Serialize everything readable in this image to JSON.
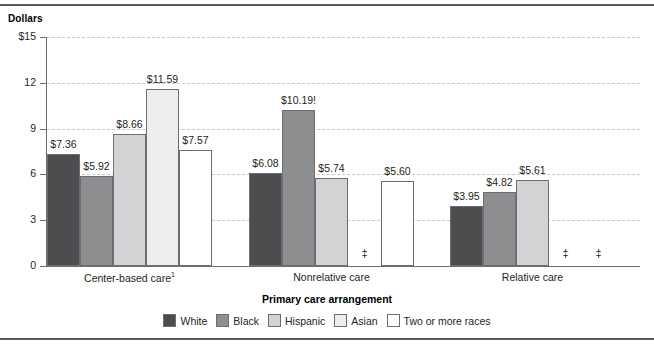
{
  "axis_title_label": "Primary care arrangement",
  "y_axis_caption": "Dollars",
  "legend": {
    "items": [
      {
        "label": "White",
        "color": "#4d4d4f"
      },
      {
        "label": "Black",
        "color": "#8d8e90"
      },
      {
        "label": "Hispanic",
        "color": "#d2d3d4"
      },
      {
        "label": "Asian",
        "color": "#eceded"
      },
      {
        "label": "Two or more races",
        "color": "#ffffff"
      }
    ]
  },
  "suppressed_marker": "‡",
  "chart_data": {
    "type": "bar",
    "title": "",
    "subtitle": "",
    "xlabel": "Primary care arrangement",
    "ylabel": "Dollars",
    "ylim": [
      0,
      15
    ],
    "yticks": [
      0,
      3,
      6,
      9,
      12,
      15
    ],
    "ytick_labels": [
      "0",
      "3",
      "6",
      "9",
      "12",
      "$15"
    ],
    "grid": true,
    "legend_position": "bottom",
    "categories": [
      "Center-based care¹",
      "Nonrelative care",
      "Relative care"
    ],
    "category_labels": [
      {
        "text": "Center-based care",
        "footnote": "1"
      },
      {
        "text": "Nonrelative care",
        "footnote": ""
      },
      {
        "text": "Relative care",
        "footnote": ""
      }
    ],
    "series": [
      {
        "name": "White",
        "color": "#4d4d4f",
        "values": [
          7.36,
          6.08,
          3.95
        ],
        "labels": [
          "$7.36",
          "$6.08",
          "$3.95"
        ]
      },
      {
        "name": "Black",
        "color": "#8d8e90",
        "values": [
          5.92,
          10.19,
          4.82
        ],
        "labels": [
          "$5.92",
          "$10.19!",
          "$4.82"
        ]
      },
      {
        "name": "Hispanic",
        "color": "#d2d3d4",
        "values": [
          8.66,
          5.74,
          5.61
        ],
        "labels": [
          "$8.66",
          "$5.74",
          "$5.61"
        ]
      },
      {
        "name": "Asian",
        "color": "#eceded",
        "values": [
          11.59,
          null,
          null
        ],
        "labels": [
          "$11.59",
          "‡",
          "‡"
        ]
      },
      {
        "name": "Two or more races",
        "color": "#ffffff",
        "values": [
          7.57,
          5.6,
          null
        ],
        "labels": [
          "$7.57",
          "$5.60",
          "‡"
        ]
      }
    ],
    "annotations": [
      {
        "text": "!",
        "meaning": "interpret data with caution",
        "attached_to": "Black / Nonrelative care"
      },
      {
        "text": "‡",
        "meaning": "reporting standards not met",
        "attached_to": "Asian / Nonrelative care"
      },
      {
        "text": "‡",
        "meaning": "reporting standards not met",
        "attached_to": "Asian / Relative care"
      },
      {
        "text": "‡",
        "meaning": "reporting standards not met",
        "attached_to": "Two or more races / Relative care"
      }
    ]
  }
}
